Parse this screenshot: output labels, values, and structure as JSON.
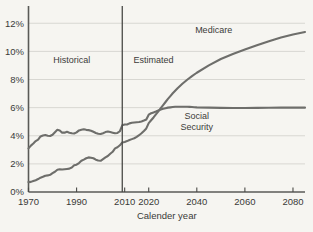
{
  "chart_data": {
    "type": "line",
    "title": "",
    "xlabel": "Calender year",
    "ylabel": "",
    "xlim": [
      1970,
      2085
    ],
    "ylim": [
      0,
      12.8
    ],
    "grid": true,
    "legend_position": "inline-annotations",
    "x_ticks": [
      1970,
      1990,
      2010,
      2020,
      2040,
      2060,
      2080
    ],
    "x_tick_labels": [
      "1970",
      "1990",
      "2010",
      "2020",
      "2040",
      "2060",
      "2080"
    ],
    "y_ticks": [
      0,
      2,
      4,
      6,
      8,
      10,
      12
    ],
    "y_tick_labels": [
      "0%",
      "2%",
      "4%",
      "6%",
      "8%",
      "10%",
      "12%"
    ],
    "annotations": [
      {
        "text": "Historical",
        "x": 1988,
        "y": 9.2
      },
      {
        "text": "Estimated",
        "x": 2022,
        "y": 9.2
      },
      {
        "text": "Medicare",
        "x": 2047,
        "y": 11.3
      },
      {
        "text": "Social",
        "x": 2040,
        "y": 5.2
      },
      {
        "text": "Security",
        "x": 2040,
        "y": 4.4
      }
    ],
    "divider_x": 2009,
    "series": [
      {
        "name": "Social Security",
        "color": "#6e6e6b",
        "x": [
          1970,
          1971,
          1972,
          1973,
          1974,
          1975,
          1976,
          1977,
          1978,
          1979,
          1980,
          1981,
          1982,
          1983,
          1984,
          1985,
          1986,
          1987,
          1988,
          1989,
          1990,
          1991,
          1992,
          1993,
          1994,
          1995,
          1996,
          1997,
          1998,
          1999,
          2000,
          2001,
          2002,
          2003,
          2004,
          2005,
          2006,
          2007,
          2008,
          2009,
          2010,
          2011,
          2012,
          2013,
          2014,
          2015,
          2016,
          2017,
          2018,
          2019,
          2020,
          2021,
          2022,
          2023,
          2024,
          2025,
          2026,
          2027,
          2028,
          2029,
          2030,
          2031,
          2032,
          2033,
          2034,
          2035,
          2036,
          2037,
          2038,
          2039,
          2040,
          2045,
          2050,
          2055,
          2060,
          2065,
          2070,
          2075,
          2080,
          2085
        ],
        "y": [
          3.1,
          3.3,
          3.45,
          3.62,
          3.72,
          3.95,
          4.02,
          4.05,
          4.0,
          3.98,
          4.07,
          4.25,
          4.42,
          4.38,
          4.22,
          4.22,
          4.28,
          4.22,
          4.18,
          4.16,
          4.24,
          4.38,
          4.42,
          4.46,
          4.42,
          4.4,
          4.36,
          4.28,
          4.2,
          4.14,
          4.12,
          4.18,
          4.26,
          4.3,
          4.26,
          4.22,
          4.18,
          4.2,
          4.32,
          4.74,
          4.8,
          4.8,
          4.88,
          4.92,
          4.94,
          4.96,
          4.98,
          5.02,
          5.08,
          5.16,
          5.5,
          5.6,
          5.66,
          5.72,
          5.8,
          5.86,
          5.92,
          5.96,
          6.0,
          6.02,
          6.04,
          6.06,
          6.06,
          6.06,
          6.06,
          6.06,
          6.06,
          6.05,
          6.04,
          6.03,
          6.02,
          6.0,
          5.98,
          5.97,
          5.97,
          5.98,
          5.99,
          6.0,
          6.0,
          6.0
        ]
      },
      {
        "name": "Medicare",
        "color": "#6e6e6b",
        "x": [
          1970,
          1971,
          1972,
          1973,
          1974,
          1975,
          1976,
          1977,
          1978,
          1979,
          1980,
          1981,
          1982,
          1983,
          1984,
          1985,
          1986,
          1987,
          1988,
          1989,
          1990,
          1991,
          1992,
          1993,
          1994,
          1995,
          1996,
          1997,
          1998,
          1999,
          2000,
          2001,
          2002,
          2003,
          2004,
          2005,
          2006,
          2007,
          2008,
          2009,
          2010,
          2011,
          2012,
          2013,
          2014,
          2015,
          2016,
          2017,
          2018,
          2019,
          2020,
          2021,
          2022,
          2023,
          2024,
          2025,
          2026,
          2027,
          2028,
          2029,
          2030,
          2032,
          2034,
          2036,
          2038,
          2040,
          2045,
          2050,
          2055,
          2060,
          2065,
          2070,
          2075,
          2080,
          2085
        ],
        "y": [
          0.7,
          0.72,
          0.78,
          0.84,
          0.92,
          1.02,
          1.08,
          1.16,
          1.18,
          1.22,
          1.34,
          1.44,
          1.58,
          1.62,
          1.6,
          1.62,
          1.64,
          1.66,
          1.74,
          1.9,
          1.94,
          2.06,
          2.22,
          2.3,
          2.4,
          2.46,
          2.44,
          2.4,
          2.3,
          2.24,
          2.22,
          2.34,
          2.46,
          2.56,
          2.72,
          2.86,
          3.1,
          3.18,
          3.32,
          3.52,
          3.56,
          3.62,
          3.7,
          3.76,
          3.82,
          3.92,
          4.04,
          4.18,
          4.34,
          4.52,
          4.9,
          5.1,
          5.3,
          5.52,
          5.74,
          5.96,
          6.18,
          6.4,
          6.62,
          6.82,
          7.02,
          7.38,
          7.7,
          7.98,
          8.24,
          8.48,
          9.0,
          9.46,
          9.82,
          10.14,
          10.44,
          10.72,
          10.98,
          11.2,
          11.38
        ]
      }
    ]
  }
}
